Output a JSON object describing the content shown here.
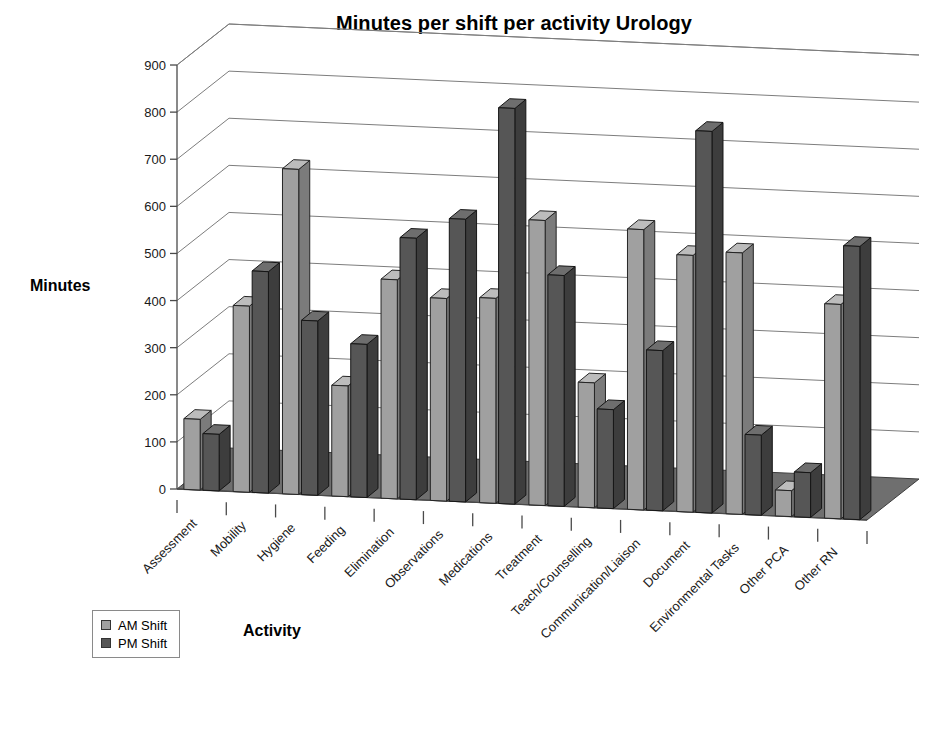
{
  "chart_data": {
    "type": "bar",
    "title": "Minutes per shift per activity Urology",
    "xlabel": "Activity",
    "ylabel": "Minutes",
    "ylim": [
      0,
      900
    ],
    "ytick_labels": [
      "0",
      "100",
      "200",
      "300",
      "400",
      "500",
      "600",
      "700",
      "800",
      "900"
    ],
    "ytick_values": [
      0,
      100,
      200,
      300,
      400,
      500,
      600,
      700,
      800,
      900
    ],
    "grid": true,
    "legend_position": "bottom-left",
    "projection": "3d-column",
    "categories": [
      "Assessment",
      "Mobility",
      "Hygiene",
      "Feeding",
      "Elimination",
      "Observations",
      "Medications",
      "Treatment",
      "Teach/Counselling",
      "Communication/Liaison",
      "Document",
      "Environmental Tasks",
      "Other PCA",
      "Other RN"
    ],
    "series": [
      {
        "name": "AM Shift",
        "color": "#a0a0a0",
        "values": [
          150,
          395,
          690,
          235,
          465,
          430,
          435,
          605,
          265,
          595,
          545,
          555,
          55,
          455
        ]
      },
      {
        "name": "PM Shift",
        "color": "#565656",
        "values": [
          120,
          470,
          370,
          325,
          555,
          600,
          840,
          490,
          210,
          340,
          810,
          170,
          95,
          580
        ]
      }
    ]
  },
  "legend": {
    "items": [
      {
        "label": "AM Shift",
        "swatch": "am"
      },
      {
        "label": "PM Shift",
        "swatch": "pm"
      }
    ]
  }
}
